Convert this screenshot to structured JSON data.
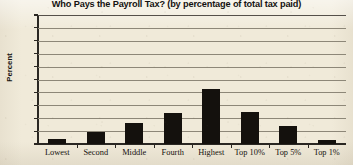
{
  "chart_data": {
    "type": "bar",
    "title": "Who Pays the Payroll Tax? (by percentage of total tax paid)",
    "xlabel": "",
    "ylabel": "Percent",
    "categories": [
      "Lowest",
      "Second",
      "Middle",
      "Fourth",
      "Highest",
      "Top 10%",
      "Top 5%",
      "Top 1%"
    ],
    "values": [
      4,
      9,
      16,
      24,
      43,
      25,
      14,
      3
    ],
    "ylim": [
      0,
      100
    ],
    "ytick_labels": [
      "100",
      "90",
      "80",
      "70",
      "60",
      "50",
      "40",
      "30",
      "20",
      "10",
      "0"
    ],
    "ytick_values": [
      100,
      90,
      80,
      70,
      60,
      50,
      40,
      30,
      20,
      10,
      0
    ],
    "grid": true,
    "legend": false,
    "bar_color": "#14110d",
    "background_color": "#f0ead9",
    "gridline_color": "#8d8778",
    "axis_color": "#2a2722"
  }
}
